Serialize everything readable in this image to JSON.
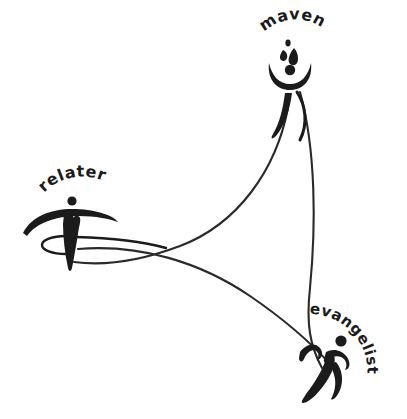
{
  "canvas": {
    "width": 407,
    "height": 419,
    "background_color": "#ffffff",
    "ink_color": "#1b1b1b"
  },
  "diagram": {
    "type": "relationship-triad-logo",
    "title_text": "",
    "node_count": 3,
    "nodes": [
      {
        "id": "maven",
        "label": "maven",
        "position": "top-right",
        "center_x": 292,
        "center_y": 70,
        "label_arc_text": "maven",
        "figure_style": "bowl-and-dot figure with teardrop sparks above and tapered swoosh body"
      },
      {
        "id": "relater",
        "label": "relater",
        "position": "left",
        "center_x": 75,
        "center_y": 225,
        "label_arc_text": "relater",
        "figure_style": "dot head with wide swoosh arc and heart-notched tapered body ringed by an ellipse"
      },
      {
        "id": "evangelist",
        "label": "evangelist",
        "position": "bottom-right",
        "center_x": 333,
        "center_y": 360,
        "label_arc_text": "evangelist",
        "figure_style": "running stick figure with dot head, swept arms and striding legs"
      }
    ],
    "connections": [
      {
        "from": "maven",
        "to": "relater",
        "style": "thin-curve"
      },
      {
        "from": "relater",
        "to": "evangelist",
        "style": "thin-curve"
      },
      {
        "from": "maven",
        "to": "evangelist",
        "style": "thin-curve"
      }
    ]
  },
  "labels": {
    "maven": "maven",
    "relater": "relater",
    "evangelist": "evangelist"
  }
}
